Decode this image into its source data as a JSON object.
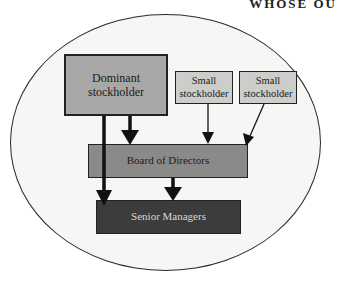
{
  "header": {
    "partial_text": "WHOSE OU"
  },
  "diagram": {
    "container": "ellipse",
    "nodes": [
      {
        "id": "dominant",
        "label": "Dominant stockholder",
        "lines": [
          "Dominant",
          "stockholder"
        ],
        "fill": "#a8a8a6"
      },
      {
        "id": "small1",
        "label": "Small stockholder",
        "lines": [
          "Small",
          "stockholder"
        ],
        "fill": "#cdcdcb"
      },
      {
        "id": "small2",
        "label": "Small stockholder",
        "lines": [
          "Small",
          "stockholder"
        ],
        "fill": "#cdcdcb"
      },
      {
        "id": "board",
        "label": "Board of Directors",
        "fill": "#8a8a88"
      },
      {
        "id": "senior",
        "label": "Senior Managers",
        "fill": "#3c3c3c"
      }
    ],
    "edges": [
      {
        "from": "dominant",
        "to": "senior",
        "weight": "thick"
      },
      {
        "from": "dominant",
        "to": "board",
        "weight": "thick"
      },
      {
        "from": "small1",
        "to": "board",
        "weight": "thin"
      },
      {
        "from": "small2",
        "to": "board",
        "weight": "thin"
      },
      {
        "from": "board",
        "to": "senior",
        "weight": "thick"
      }
    ]
  }
}
